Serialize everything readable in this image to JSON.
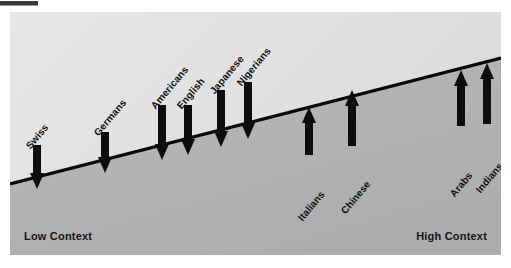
{
  "figure": {
    "type": "conceptual-scale-diagram",
    "axis_labels": {
      "left": "Low Context",
      "right": "High Context"
    },
    "colors": {
      "upper_region": "#e4e4e4",
      "lower_region": "#b4b4b4",
      "divider_line": "#0a0a0a",
      "arrow": "#0d0d0d",
      "text": "#101010",
      "page_background": "#ffffff"
    },
    "divider": {
      "description": "black diagonal line rising from lower-left to upper-right",
      "x1": 0,
      "y1": 172,
      "x2": 491,
      "y2": 46
    },
    "cultures": [
      {
        "name": "Swiss",
        "arrow": "down",
        "arrow_x": 27,
        "arrow_top": 133,
        "arrow_bottom": 177,
        "label_x": 22,
        "label_y": 128
      },
      {
        "name": "Germans",
        "arrow": "down",
        "arrow_x": 95,
        "arrow_top": 120,
        "arrow_bottom": 161,
        "label_x": 90,
        "label_y": 115
      },
      {
        "name": "Americans",
        "arrow": "down",
        "arrow_x": 152,
        "arrow_top": 93,
        "arrow_bottom": 148,
        "label_x": 147,
        "label_y": 88
      },
      {
        "name": "English",
        "arrow": "down",
        "arrow_x": 178,
        "arrow_top": 93,
        "arrow_bottom": 143,
        "label_x": 173,
        "label_y": 88
      },
      {
        "name": "Japanese",
        "arrow": "down",
        "arrow_x": 211,
        "arrow_top": 78,
        "arrow_bottom": 135,
        "label_x": 206,
        "label_y": 73
      },
      {
        "name": "Nigerians",
        "arrow": "down",
        "arrow_x": 238,
        "arrow_top": 70,
        "arrow_bottom": 127,
        "label_x": 233,
        "label_y": 65
      },
      {
        "name": "Italians",
        "arrow": "up",
        "arrow_x": 299,
        "arrow_top": 95,
        "arrow_bottom": 143,
        "label_x": 294,
        "label_y": 200
      },
      {
        "name": "Chinese",
        "arrow": "up",
        "arrow_x": 342,
        "arrow_top": 78,
        "arrow_bottom": 134,
        "label_x": 337,
        "label_y": 193
      },
      {
        "name": "Arabs",
        "arrow": "up",
        "arrow_x": 451,
        "arrow_top": 58,
        "arrow_bottom": 114,
        "label_x": 446,
        "label_y": 176
      },
      {
        "name": "Indians",
        "arrow": "up",
        "arrow_x": 477,
        "arrow_top": 51,
        "arrow_bottom": 112,
        "label_x": 472,
        "label_y": 172
      }
    ]
  }
}
